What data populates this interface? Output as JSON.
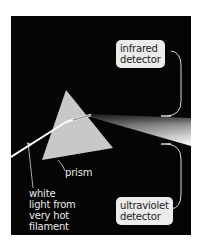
{
  "diagram": {
    "colors": {
      "background": "#050505",
      "prism": "#c8c8c8",
      "label_box": "#ececec",
      "label_text_dark": "#222222",
      "label_text_light": "#e8e8e8"
    },
    "labels": {
      "infrared_detector": {
        "line1": "infrared",
        "line2": "detector"
      },
      "ultraviolet_detector": {
        "line1": "ultraviolet",
        "line2": "detector"
      },
      "prism": "prism",
      "white_light": {
        "line1": "white",
        "line2": "light from",
        "line3": "very hot",
        "line4": "filament"
      }
    }
  }
}
